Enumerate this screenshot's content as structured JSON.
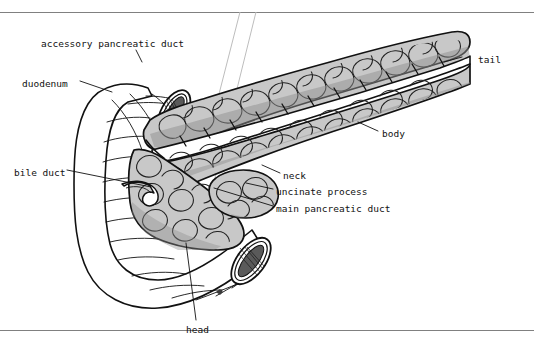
{
  "figure": {
    "border_color": "#808080",
    "background": "#ffffff",
    "ink_color": "#111111",
    "parenchyma_fill": "#c8c8c8",
    "parenchyma_shadow": "#8f8f8f",
    "duct_fill": "#ffffff",
    "duodenum_fill": "#ffffff",
    "lumen_fill": "#4a4a4a"
  },
  "labels": [
    {
      "id": "accessory-pancreatic-duct",
      "text": "accessory pancreatic duct",
      "x": 41,
      "y": 44,
      "anchor": "start"
    },
    {
      "id": "duodenum",
      "text": "duodenum",
      "x": 22,
      "y": 84,
      "anchor": "start"
    },
    {
      "id": "bile-duct",
      "text": "bile duct",
      "x": 14,
      "y": 173,
      "anchor": "start"
    },
    {
      "id": "tail",
      "text": "tail",
      "x": 478,
      "y": 60,
      "anchor": "start"
    },
    {
      "id": "body",
      "text": "body",
      "x": 382,
      "y": 134,
      "anchor": "start"
    },
    {
      "id": "neck",
      "text": "neck",
      "x": 283,
      "y": 176,
      "anchor": "start"
    },
    {
      "id": "uncinate-process",
      "text": "uncinate process",
      "x": 276,
      "y": 192,
      "anchor": "start"
    },
    {
      "id": "main-pancreatic-duct",
      "text": "main pancreatic duct",
      "x": 276,
      "y": 209,
      "anchor": "start"
    },
    {
      "id": "head",
      "text": "head",
      "x": 186,
      "y": 330,
      "anchor": "start"
    }
  ],
  "leaders": [
    {
      "id": "leader-accessory-pancreatic-duct",
      "d": "M136,50 L142,62"
    },
    {
      "id": "leader-duodenum",
      "d": "M80,81 L112,92"
    },
    {
      "id": "leader-bile-duct",
      "d": "M67,170 L151,187"
    },
    {
      "id": "leader-tail",
      "d": "M462,57 L444,62"
    },
    {
      "id": "leader-body",
      "d": "M378,131 L358,122"
    },
    {
      "id": "leader-neck",
      "d": "M280,173 L262,165"
    },
    {
      "id": "leader-uncinate-process",
      "d": "M273,189 L246,183"
    },
    {
      "id": "leader-main-pancreatic-duct",
      "d": "M273,206 L214,188"
    },
    {
      "id": "leader-head",
      "d": "M196,320 L186,243"
    }
  ],
  "guide_lines": [
    {
      "id": "guide-left",
      "d": "M240,12 L197,180"
    },
    {
      "id": "guide-right",
      "d": "M256,12 L212,190"
    }
  ]
}
